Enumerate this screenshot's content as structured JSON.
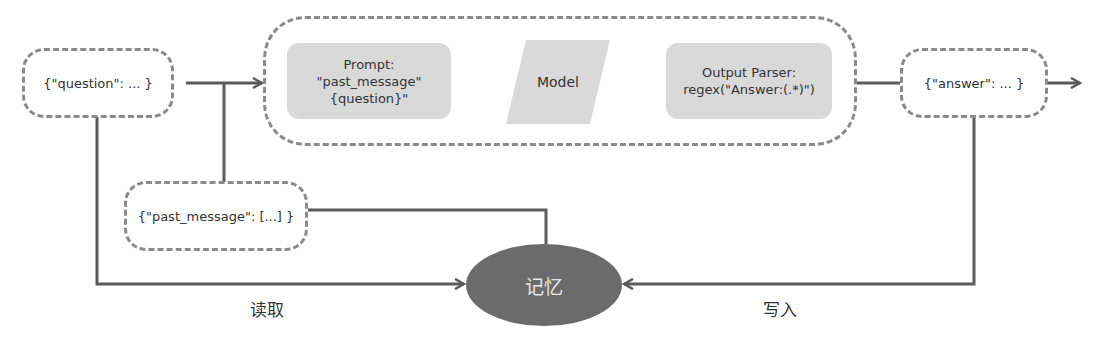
{
  "nodes": {
    "question": "{\"question\": ... }",
    "past_message": "{\"past_message\": [...] }",
    "answer": "{\"answer\": ... }",
    "prompt": {
      "line1": "Prompt:",
      "line2": "\"past_message\"",
      "line3": "{question}\""
    },
    "model": "Model",
    "output_parser": {
      "line1": "Output Parser:",
      "line2": "regex(\"Answer:(.*)\")"
    },
    "memory": "记忆"
  },
  "edges": {
    "read_label": "读取",
    "write_label": "写入"
  },
  "colors": {
    "line": "#5a5a5a",
    "dash_border": "#8a8a8a",
    "component_fill": "#d9d9d9",
    "memory_fill": "#6b6b6b"
  }
}
